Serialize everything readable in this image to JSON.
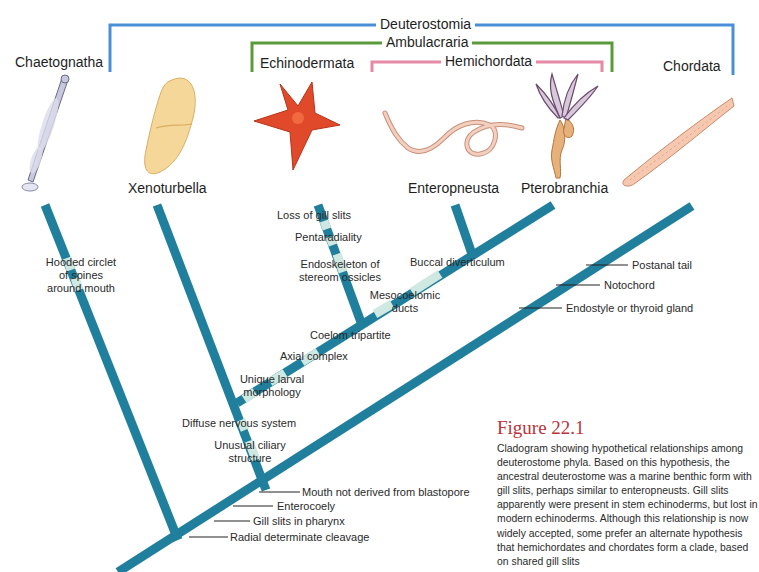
{
  "colors": {
    "branch": "#1f7f9c",
    "branch_highlight": "#cfe8e2",
    "deuterostomia_bracket": "#4a8fd6",
    "ambulacraria_bracket": "#5a9a3a",
    "hemichordata_bracket": "#e58aa4",
    "figure_title": "#b8343a"
  },
  "clades": {
    "deuterostomia": "Deuterostomia",
    "ambulacraria": "Ambulacraria",
    "hemichordata": "Hemichordata"
  },
  "taxa": {
    "chaetognatha": "Chaetognatha",
    "xenoturbella": "Xenoturbella",
    "echinodermata": "Echinodermata",
    "enteropneusta": "Enteropneusta",
    "pterobranchia": "Pterobranchia",
    "chordata": "Chordata"
  },
  "characters": {
    "chaetognatha": "Hooded circlet\nof spines\naround mouth",
    "loss_gill_slits": "Loss of gill slits",
    "pentaradiality": "Pentaradiality",
    "endoskeleton": "Endoskeleton of\nstereom ossicles",
    "buccal": "Buccal diverticulum",
    "mesocoelomic": "Mesocoelomic\nducts",
    "coelom": "Coelom tripartite",
    "axial": "Axial complex",
    "larval": "Unique larval\nmorphology",
    "diffuse": "Diffuse nervous system",
    "ciliary": "Unusual ciliary\nstructure",
    "postanal": "Postanal tail",
    "notochord": "Notochord",
    "endostyle": "Endostyle or thyroid gland",
    "mouth": "Mouth not derived from blastopore",
    "enterocoely": "Enterocoely",
    "gill_pharynx": "Gill slits in pharynx",
    "radial": "Radial determinate cleavage"
  },
  "figure": {
    "title": "Figure 22.1",
    "caption": "Cladogram showing hypothetical relationships among deuterostome phyla. Based on this hypothesis, the ancestral deuterostome was a marine benthic form with gill slits, perhaps similar to enteropneusts. Gill slits apparently were present in stem echinoderms, but lost in modern echinoderms. Although this relationship is now widely accepted, some prefer an alternate hypothesis that hemichordates and chordates form a clade, based on shared gill slits"
  },
  "icons": [
    "arrow-worm-illustration",
    "xenoturbella-illustration",
    "sea-star-illustration",
    "acorn-worm-illustration",
    "pterobranch-illustration",
    "lancelet-illustration"
  ]
}
